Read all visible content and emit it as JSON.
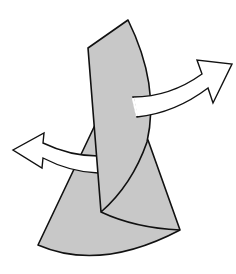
{
  "diagram": {
    "type": "folding-instruction",
    "colors": {
      "background": "#ffffff",
      "paper_fill": "#c8c8c8",
      "outline": "#111111",
      "arrow_fill": "#ffffff"
    },
    "elements": [
      {
        "name": "lower-cone",
        "label": ""
      },
      {
        "name": "upper-strip",
        "label": ""
      },
      {
        "name": "inner-fold-curve",
        "label": ""
      },
      {
        "name": "arrow-right",
        "direction": "up-right"
      },
      {
        "name": "arrow-left",
        "direction": "left"
      }
    ]
  }
}
